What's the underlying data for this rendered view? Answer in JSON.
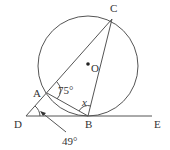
{
  "diagram": {
    "type": "geometry",
    "circle": {
      "center": "O",
      "cx": 88,
      "cy": 66,
      "r": 50
    },
    "points": {
      "C": {
        "label": "C",
        "x": 112,
        "y": 19
      },
      "A": {
        "label": "A",
        "x": 47,
        "y": 93
      },
      "B": {
        "label": "B",
        "x": 88,
        "y": 116
      },
      "D": {
        "label": "D",
        "x": 26,
        "y": 116
      },
      "E": {
        "label": "E",
        "x": 152,
        "y": 116
      },
      "O": {
        "label": "O",
        "x": 88,
        "y": 64
      }
    },
    "angles": {
      "CAB": {
        "label": "75°"
      },
      "ABC": {
        "label": "x"
      },
      "ADB": {
        "label": "49°"
      }
    },
    "stroke_color": "#555555",
    "text_color": "#333333"
  }
}
